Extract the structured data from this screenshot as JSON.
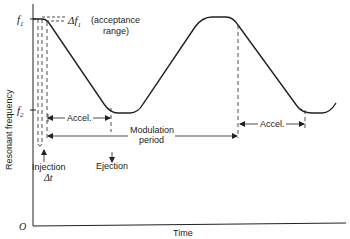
{
  "diagram": {
    "y_axis_label": "Resonant frequency",
    "x_axis_label": "Time",
    "origin_label": "O",
    "f1_label": "f",
    "f1_sub": "1",
    "f2_label": "f",
    "f2_sub": "2",
    "delta_f_label": "Δf",
    "delta_f_sub": "1",
    "acceptance_label": "(acceptance",
    "acceptance_label_2": "range)",
    "accel_label_1": "Accel.",
    "accel_label_2": "Accel.",
    "modulation_label_1": "Modulation",
    "modulation_label_2": "period",
    "injection_label": "Injection",
    "injection_dt": "Δt",
    "ejection_label": "Ejection",
    "line_color": "#222222"
  }
}
